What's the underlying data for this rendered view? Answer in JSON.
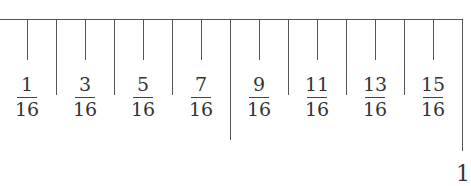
{
  "ruler": {
    "fractions": [
      {
        "num": "1",
        "den": "16"
      },
      {
        "num": "3",
        "den": "16"
      },
      {
        "num": "5",
        "den": "16"
      },
      {
        "num": "7",
        "den": "16"
      },
      {
        "num": "9",
        "den": "16"
      },
      {
        "num": "11",
        "den": "16"
      },
      {
        "num": "13",
        "den": "16"
      },
      {
        "num": "15",
        "den": "16"
      }
    ],
    "end_label": "1"
  }
}
